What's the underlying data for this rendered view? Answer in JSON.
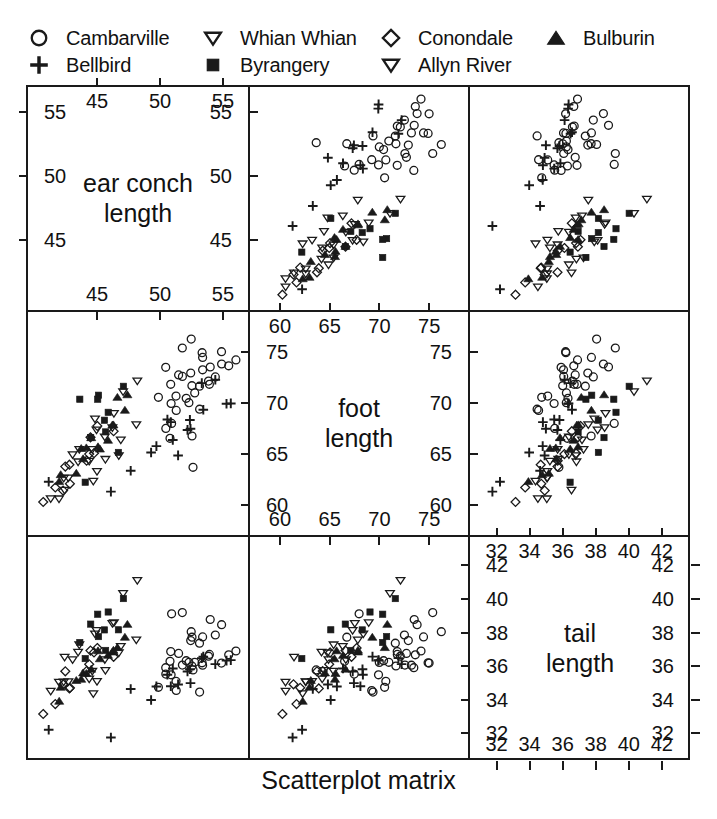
{
  "caption": "Scatterplot matrix",
  "legend": {
    "items": [
      {
        "label": "Cambarville",
        "symbol": "circle-open",
        "x": 28,
        "y": 25
      },
      {
        "label": "Whian Whian",
        "symbol": "triangle-down-open",
        "x": 202,
        "y": 25
      },
      {
        "label": "Conondale",
        "symbol": "diamond-open",
        "x": 380,
        "y": 25
      },
      {
        "label": "Bulburin",
        "symbol": "triangle-up-filled",
        "x": 545,
        "y": 25
      },
      {
        "label": "Bellbird",
        "symbol": "plus",
        "x": 28,
        "y": 52
      },
      {
        "label": "Byrangery",
        "symbol": "square-filled",
        "x": 202,
        "y": 52
      },
      {
        "label": "Allyn River",
        "symbol": "triangle-down-open2",
        "x": 380,
        "y": 52
      }
    ]
  },
  "variables": [
    {
      "key": "earconch",
      "name_line1": "ear conch",
      "name_line2": "length",
      "min": 40.3,
      "max": 56.2,
      "ticks": [
        45,
        50,
        55
      ]
    },
    {
      "key": "footlgth",
      "name_line1": "foot",
      "name_line2": "length",
      "min": 58.0,
      "max": 77.9,
      "ticks": [
        60,
        65,
        70,
        75
      ]
    },
    {
      "key": "taill",
      "name_line1": "tail",
      "name_line2": "length",
      "min": 31.0,
      "max": 43.1,
      "ticks": [
        32,
        34,
        36,
        38,
        40,
        42
      ]
    }
  ],
  "chart_data": {
    "type": "scatter",
    "title": "Scatterplot matrix",
    "matrix": true,
    "grid": false,
    "legend_position": "top",
    "dimensions": [
      "earconch",
      "footlgth",
      "taill"
    ],
    "axis_labels": {
      "earconch": "ear conch length",
      "footlgth": "foot length",
      "taill": "tail length"
    },
    "axis_ranges": {
      "earconch": [
        40.3,
        56.2
      ],
      "footlgth": [
        58.0,
        77.9
      ],
      "taill": [
        31.0,
        43.1
      ]
    },
    "axis_ticks": {
      "earconch": [
        45,
        50,
        55
      ],
      "footlgth": [
        60,
        65,
        70,
        75
      ],
      "taill": [
        32,
        34,
        36,
        38,
        40,
        42
      ]
    },
    "groups": [
      {
        "name": "Cambarville",
        "symbol": "circle-open"
      },
      {
        "name": "Bellbird",
        "symbol": "plus"
      },
      {
        "name": "Whian Whian",
        "symbol": "triangle-down-open"
      },
      {
        "name": "Byrangery",
        "symbol": "square-filled"
      },
      {
        "name": "Conondale",
        "symbol": "diamond-open"
      },
      {
        "name": "Allyn River",
        "symbol": "triangle-down-open2"
      },
      {
        "name": "Bulburin",
        "symbol": "triangle-up-filled"
      }
    ],
    "series": [
      {
        "name": "Cambarville",
        "symbol": "circle-open",
        "points": [
          {
            "taill": 36.0,
            "footlgth": 74.5,
            "earconch": 54.5
          },
          {
            "taill": 36.5,
            "footlgth": 72.5,
            "earconch": 51.2
          },
          {
            "taill": 39.0,
            "footlgth": 75.4,
            "earconch": 51.9
          },
          {
            "taill": 38.0,
            "footlgth": 76.1,
            "earconch": 52.2
          },
          {
            "taill": 36.0,
            "footlgth": 71.0,
            "earconch": 53.2
          },
          {
            "taill": 36.5,
            "footlgth": 72.7,
            "earconch": 53.6
          },
          {
            "taill": 39.0,
            "footlgth": 68.0,
            "earconch": 51.4
          },
          {
            "taill": 38.0,
            "footlgth": 73.2,
            "earconch": 53.9
          },
          {
            "taill": 36.0,
            "footlgth": 63.2,
            "earconch": 52.6
          },
          {
            "taill": 36.0,
            "footlgth": 75.4,
            "earconch": 53.2
          },
          {
            "taill": 35.5,
            "footlgth": 71.2,
            "earconch": 51.8
          },
          {
            "taill": 38.0,
            "footlgth": 66.0,
            "earconch": 52.0
          },
          {
            "taill": 36.5,
            "footlgth": 72.4,
            "earconch": 51.3
          },
          {
            "taill": 36.5,
            "footlgth": 72.4,
            "earconch": 53.9
          },
          {
            "taill": 36.0,
            "footlgth": 73.2,
            "earconch": 50.5
          },
          {
            "taill": 37.0,
            "footlgth": 71.2,
            "earconch": 53.2
          },
          {
            "taill": 34.7,
            "footlgth": 68.6,
            "earconch": 53.2
          },
          {
            "taill": 36.0,
            "footlgth": 72.8,
            "earconch": 51.8
          },
          {
            "taill": 37.5,
            "footlgth": 73.0,
            "earconch": 52.1
          },
          {
            "taill": 36.5,
            "footlgth": 69.7,
            "earconch": 51.8
          },
          {
            "taill": 36.0,
            "footlgth": 71.0,
            "earconch": 53.0
          },
          {
            "taill": 37.0,
            "footlgth": 72.5,
            "earconch": 54.0
          },
          {
            "taill": 38.5,
            "footlgth": 74.0,
            "earconch": 54.5
          },
          {
            "taill": 35.0,
            "footlgth": 70.0,
            "earconch": 50.0
          },
          {
            "taill": 35.5,
            "footlgth": 70.5,
            "earconch": 50.8
          },
          {
            "taill": 37.2,
            "footlgth": 73.8,
            "earconch": 55.5
          },
          {
            "taill": 36.8,
            "footlgth": 74.2,
            "earconch": 55.8
          },
          {
            "taill": 36.2,
            "footlgth": 66.5,
            "earconch": 51.0
          },
          {
            "taill": 35.8,
            "footlgth": 67.5,
            "earconch": 50.2
          },
          {
            "taill": 37.8,
            "footlgth": 75.0,
            "earconch": 53.5
          },
          {
            "taill": 36.3,
            "footlgth": 70.8,
            "earconch": 52.4
          },
          {
            "taill": 34.5,
            "footlgth": 69.0,
            "earconch": 51.5
          },
          {
            "taill": 38.2,
            "footlgth": 73.5,
            "earconch": 54.8
          }
        ]
      },
      {
        "name": "Bellbird",
        "symbol": "plus",
        "points": [
          {
            "taill": 32.0,
            "footlgth": 62.0,
            "earconch": 46.0
          },
          {
            "taill": 32.0,
            "footlgth": 62.8,
            "earconch": 41.0
          },
          {
            "taill": 34.5,
            "footlgth": 67.5,
            "earconch": 50.5
          },
          {
            "taill": 36.0,
            "footlgth": 70.5,
            "earconch": 55.5
          },
          {
            "taill": 36.5,
            "footlgth": 71.8,
            "earconch": 54.2
          },
          {
            "taill": 36.0,
            "footlgth": 69.0,
            "earconch": 52.0
          },
          {
            "taill": 35.5,
            "footlgth": 68.5,
            "earconch": 51.0
          },
          {
            "taill": 35.0,
            "footlgth": 66.5,
            "earconch": 50.0
          },
          {
            "taill": 36.5,
            "footlgth": 70.0,
            "earconch": 53.0
          },
          {
            "taill": 34.0,
            "footlgth": 65.0,
            "earconch": 49.5
          },
          {
            "taill": 35.2,
            "footlgth": 67.8,
            "earconch": 52.8
          },
          {
            "taill": 36.2,
            "footlgth": 70.2,
            "earconch": 54.8
          },
          {
            "taill": 35.0,
            "footlgth": 64.5,
            "earconch": 51.5
          },
          {
            "taill": 36.8,
            "footlgth": 72.0,
            "earconch": 53.5
          },
          {
            "taill": 34.8,
            "footlgth": 63.5,
            "earconch": 48.0
          },
          {
            "taill": 35.5,
            "footlgth": 66.0,
            "earconch": 51.2
          },
          {
            "taill": 36.0,
            "footlgth": 68.0,
            "earconch": 52.5
          }
        ]
      },
      {
        "name": "Whian Whian",
        "symbol": "triangle-down-open",
        "points": [
          {
            "taill": 35.0,
            "footlgth": 65.0,
            "earconch": 44.0
          },
          {
            "taill": 36.0,
            "footlgth": 65.5,
            "earconch": 45.0
          },
          {
            "taill": 37.0,
            "footlgth": 64.0,
            "earconch": 46.5
          },
          {
            "taill": 35.5,
            "footlgth": 63.0,
            "earconch": 43.0
          },
          {
            "taill": 36.5,
            "footlgth": 66.0,
            "earconch": 45.5
          },
          {
            "taill": 34.5,
            "footlgth": 62.5,
            "earconch": 44.5
          },
          {
            "taill": 37.5,
            "footlgth": 67.0,
            "earconch": 47.0
          },
          {
            "taill": 36.0,
            "footlgth": 64.5,
            "earconch": 46.0
          },
          {
            "taill": 35.5,
            "footlgth": 63.5,
            "earconch": 45.2
          },
          {
            "taill": 38.0,
            "footlgth": 68.0,
            "earconch": 48.0
          }
        ]
      },
      {
        "name": "Byrangery",
        "symbol": "square-filled",
        "points": [
          {
            "taill": 38.0,
            "footlgth": 71.5,
            "earconch": 45.0
          },
          {
            "taill": 39.0,
            "footlgth": 69.5,
            "earconch": 46.0
          },
          {
            "taill": 37.5,
            "footlgth": 70.0,
            "earconch": 43.5
          },
          {
            "taill": 38.5,
            "footlgth": 67.0,
            "earconch": 44.5
          },
          {
            "taill": 37.0,
            "footlgth": 66.5,
            "earconch": 45.5
          },
          {
            "taill": 40.0,
            "footlgth": 72.0,
            "earconch": 47.0
          },
          {
            "taill": 36.5,
            "footlgth": 63.0,
            "earconch": 44.0
          },
          {
            "taill": 38.2,
            "footlgth": 68.5,
            "earconch": 45.8
          },
          {
            "taill": 37.8,
            "footlgth": 65.5,
            "earconch": 46.5
          },
          {
            "taill": 39.5,
            "footlgth": 70.8,
            "earconch": 44.8
          }
        ]
      },
      {
        "name": "Conondale",
        "symbol": "diamond-open",
        "points": [
          {
            "taill": 34.0,
            "footlgth": 62.0,
            "earconch": 41.5
          },
          {
            "taill": 35.0,
            "footlgth": 63.5,
            "earconch": 42.5
          },
          {
            "taill": 36.0,
            "footlgth": 65.0,
            "earconch": 44.0
          },
          {
            "taill": 35.5,
            "footlgth": 64.0,
            "earconch": 43.0
          },
          {
            "taill": 34.5,
            "footlgth": 61.5,
            "earconch": 42.0
          },
          {
            "taill": 37.0,
            "footlgth": 66.0,
            "earconch": 45.0
          },
          {
            "taill": 36.5,
            "footlgth": 65.5,
            "earconch": 44.5
          },
          {
            "taill": 33.5,
            "footlgth": 60.5,
            "earconch": 40.5
          },
          {
            "taill": 35.8,
            "footlgth": 64.2,
            "earconch": 43.8
          },
          {
            "taill": 36.2,
            "footlgth": 66.5,
            "earconch": 46.0
          },
          {
            "taill": 34.8,
            "footlgth": 62.5,
            "earconch": 42.8
          },
          {
            "taill": 37.5,
            "footlgth": 67.5,
            "earconch": 45.5
          }
        ]
      },
      {
        "name": "Allyn River",
        "symbol": "triangle-down-open2",
        "points": [
          {
            "taill": 36.0,
            "footlgth": 65.0,
            "earconch": 43.0
          },
          {
            "taill": 37.0,
            "footlgth": 66.0,
            "earconch": 44.0
          },
          {
            "taill": 38.0,
            "footlgth": 67.5,
            "earconch": 45.0
          },
          {
            "taill": 36.5,
            "footlgth": 64.5,
            "earconch": 43.5
          },
          {
            "taill": 35.5,
            "footlgth": 63.0,
            "earconch": 42.5
          },
          {
            "taill": 39.0,
            "footlgth": 69.0,
            "earconch": 46.0
          },
          {
            "taill": 37.5,
            "footlgth": 68.0,
            "earconch": 44.5
          },
          {
            "taill": 40.5,
            "footlgth": 70.5,
            "earconch": 47.5
          },
          {
            "taill": 41.5,
            "footlgth": 72.0,
            "earconch": 48.5
          },
          {
            "taill": 36.2,
            "footlgth": 62.0,
            "earconch": 42.0
          },
          {
            "taill": 34.5,
            "footlgth": 61.0,
            "earconch": 41.0
          },
          {
            "taill": 35.0,
            "footlgth": 60.0,
            "earconch": 41.8
          },
          {
            "taill": 38.5,
            "footlgth": 66.8,
            "earconch": 45.8
          }
        ]
      },
      {
        "name": "Bulburin",
        "symbol": "triangle-up-filled",
        "points": [
          {
            "taill": 35.0,
            "footlgth": 65.0,
            "earconch": 44.0
          },
          {
            "taill": 36.0,
            "footlgth": 66.5,
            "earconch": 45.0
          },
          {
            "taill": 37.0,
            "footlgth": 68.0,
            "earconch": 46.0
          },
          {
            "taill": 36.5,
            "footlgth": 67.0,
            "earconch": 45.5
          },
          {
            "taill": 35.5,
            "footlgth": 64.0,
            "earconch": 43.5
          },
          {
            "taill": 38.0,
            "footlgth": 69.5,
            "earconch": 47.0
          },
          {
            "taill": 34.5,
            "footlgth": 63.0,
            "earconch": 42.5
          },
          {
            "taill": 37.5,
            "footlgth": 70.0,
            "earconch": 46.5
          },
          {
            "taill": 36.2,
            "footlgth": 65.8,
            "earconch": 44.8
          },
          {
            "taill": 35.8,
            "footlgth": 64.8,
            "earconch": 44.2
          },
          {
            "taill": 38.5,
            "footlgth": 71.0,
            "earconch": 47.5
          },
          {
            "taill": 33.5,
            "footlgth": 62.0,
            "earconch": 42.0
          },
          {
            "taill": 36.8,
            "footlgth": 66.0,
            "earconch": 45.2
          },
          {
            "taill": 34.8,
            "footlgth": 63.8,
            "earconch": 43.2
          },
          {
            "taill": 37.2,
            "footlgth": 68.5,
            "earconch": 46.2
          }
        ]
      }
    ]
  }
}
